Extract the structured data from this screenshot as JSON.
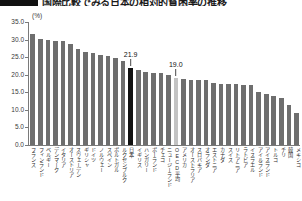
{
  "title": {
    "marker": "black-bar-marker",
    "text": "国際比較でみる日本の相対的貧困率の推移"
  },
  "chart_data": {
    "type": "bar",
    "title": "国際比較でみる日本の相対的貧困率の推移",
    "xlabel": "",
    "ylabel": "",
    "unit_label": "(%)",
    "ylim": [
      0.0,
      35.0
    ],
    "ytick_labels": [
      "0.0",
      "5.0",
      "10.0",
      "15.0",
      "20.0",
      "25.0",
      "30.0",
      "35.0"
    ],
    "ytick_values": [
      0.0,
      5.0,
      10.0,
      15.0,
      20.0,
      25.0,
      30.0,
      35.0
    ],
    "grid": false,
    "legend": "none",
    "bar_color": "#6e6e6e",
    "highlight_colors": {
      "japan": "#111111",
      "oecd": "#c3c3c3"
    },
    "categories": [
      "フランス",
      "フィンランド",
      "ベルギー",
      "デンマーク",
      "イタリア",
      "オーストリア",
      "スウェーデン",
      "ギリシャ",
      "ドイツ",
      "ノルウェー",
      "スペイン",
      "ポルトガル",
      "ルクセンブルク",
      "日本",
      "イギリス",
      "ハンガリー",
      "ポーランド",
      "チェコ",
      "ニュージーランド",
      "OECD平均",
      "アメリカ",
      "オーストラリア",
      "スロバキア",
      "オランダ",
      "エストニア",
      "カナダ",
      "スイス",
      "リトアニア",
      "ラトビア",
      "イスラエル",
      "アイルランド",
      "アイスランド",
      "トルコ",
      "チリ",
      "韓国",
      "メキシコ"
    ],
    "values": [
      31.5,
      30.3,
      30.0,
      29.6,
      29.5,
      28.8,
      27.3,
      26.5,
      26.2,
      25.6,
      25.2,
      24.7,
      24.0,
      21.9,
      21.3,
      20.8,
      20.6,
      20.4,
      20.0,
      19.0,
      18.8,
      18.6,
      18.5,
      18.4,
      17.6,
      17.5,
      17.4,
      17.3,
      17.2,
      17.1,
      15.0,
      14.5,
      14.0,
      13.5,
      11.5,
      9.0
    ],
    "annotations": [
      {
        "category": "日本",
        "value": 21.9,
        "label": "21.9",
        "style": "dark-highlight"
      },
      {
        "category": "OECD平均",
        "value": 19.0,
        "label": "19.0",
        "style": "light-highlight"
      }
    ]
  }
}
